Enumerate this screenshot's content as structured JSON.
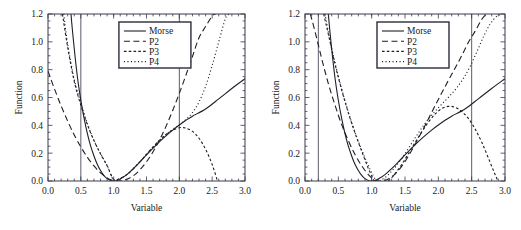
{
  "figure": {
    "panel_count": 2,
    "background_color": "#ffffff",
    "curve_color": "#1e1e28",
    "frame_color": "#3a3a4a"
  },
  "chart_data": [
    {
      "type": "line",
      "panel": "left",
      "title": "",
      "xlabel": "Variable",
      "ylabel": "Function",
      "xlim": [
        0.0,
        3.0
      ],
      "ylim": [
        0.0,
        1.2
      ],
      "xticks": [
        0.0,
        0.5,
        1.0,
        1.5,
        2.0,
        2.5,
        3.0
      ],
      "xtick_labels": [
        "0.0",
        "0.5",
        "1.0",
        "1.5",
        "2.0",
        "2.5",
        "3.0"
      ],
      "yticks": [
        0.0,
        0.2,
        0.4,
        0.6,
        0.8,
        1.0,
        1.2
      ],
      "ytick_labels": [
        "0.0",
        "0.2",
        "0.4",
        "0.6",
        "0.8",
        "1.0",
        "1.2"
      ],
      "minor_ticks": true,
      "grid": false,
      "legend_position": "upper center",
      "vertical_reference_lines": [
        0.5,
        2.0
      ],
      "fit_interval": [
        0.5,
        2.0
      ],
      "minimum": {
        "x": 1.0,
        "y": 0.0
      },
      "series": [
        {
          "name": "Morse",
          "style": "solid",
          "x": [
            0.3,
            0.35,
            0.4,
            0.45,
            0.5,
            0.55,
            0.6,
            0.65,
            0.7,
            0.75,
            0.8,
            0.85,
            0.9,
            0.95,
            1.0,
            1.05,
            1.1,
            1.2,
            1.3,
            1.4,
            1.5,
            1.6,
            1.7,
            1.8,
            1.9,
            2.0,
            2.1,
            2.2,
            2.4,
            2.6,
            2.8,
            3.0
          ],
          "y": [
            1.52,
            1.2,
            0.95,
            0.74,
            0.58,
            0.45,
            0.34,
            0.25,
            0.18,
            0.12,
            0.075,
            0.04,
            0.017,
            0.004,
            0.0,
            0.004,
            0.014,
            0.046,
            0.089,
            0.137,
            0.187,
            0.236,
            0.283,
            0.326,
            0.366,
            0.402,
            0.436,
            0.466,
            0.517,
            0.59,
            0.665,
            0.735
          ]
        },
        {
          "name": "P2",
          "style": "long-dash",
          "x": [
            0.0,
            0.1,
            0.2,
            0.3,
            0.4,
            0.5,
            0.6,
            0.7,
            0.8,
            0.9,
            1.0,
            1.1,
            1.2,
            1.3,
            1.4,
            1.5,
            1.6,
            1.7,
            1.8,
            1.9,
            2.0,
            2.1,
            2.2,
            2.3,
            2.4,
            2.5,
            2.55
          ],
          "y": [
            0.79,
            0.66,
            0.54,
            0.43,
            0.33,
            0.245,
            0.17,
            0.108,
            0.058,
            0.022,
            0.002,
            0.0,
            0.012,
            0.038,
            0.08,
            0.138,
            0.21,
            0.296,
            0.396,
            0.508,
            0.63,
            0.76,
            0.895,
            1.03,
            1.11,
            1.185,
            1.2
          ]
        },
        {
          "name": "P3",
          "style": "short-dash",
          "x": [
            0.22,
            0.3,
            0.4,
            0.5,
            0.6,
            0.7,
            0.8,
            0.9,
            1.0,
            1.1,
            1.2,
            1.3,
            1.4,
            1.5,
            1.6,
            1.7,
            1.8,
            1.9,
            2.0,
            2.05,
            2.1,
            2.2,
            2.3,
            2.4,
            2.5,
            2.6,
            2.68
          ],
          "y": [
            1.2,
            0.96,
            0.715,
            0.545,
            0.405,
            0.29,
            0.195,
            0.11,
            0.012,
            0.02,
            0.046,
            0.088,
            0.138,
            0.192,
            0.246,
            0.294,
            0.336,
            0.366,
            0.382,
            0.384,
            0.38,
            0.357,
            0.307,
            0.228,
            0.118,
            -0.03,
            -0.16
          ]
        },
        {
          "name": "P4",
          "style": "dotted",
          "x": [
            0.24,
            0.3,
            0.4,
            0.5,
            0.6,
            0.7,
            0.8,
            0.9,
            1.0,
            1.1,
            1.2,
            1.3,
            1.4,
            1.5,
            1.6,
            1.7,
            1.8,
            1.9,
            2.0,
            2.1,
            2.2,
            2.3,
            2.4,
            2.5,
            2.6,
            2.7,
            2.76
          ],
          "y": [
            1.2,
            0.98,
            0.73,
            0.56,
            0.412,
            0.292,
            0.196,
            0.11,
            0.006,
            0.018,
            0.046,
            0.09,
            0.14,
            0.192,
            0.244,
            0.292,
            0.336,
            0.372,
            0.404,
            0.442,
            0.492,
            0.568,
            0.68,
            0.83,
            1.0,
            1.165,
            1.2
          ]
        }
      ]
    },
    {
      "type": "line",
      "panel": "right",
      "title": "",
      "xlabel": "Variable",
      "ylabel": "Function",
      "xlim": [
        0.0,
        3.0
      ],
      "ylim": [
        0.0,
        1.2
      ],
      "xticks": [
        0.0,
        0.5,
        1.0,
        1.5,
        2.0,
        2.5,
        3.0
      ],
      "xtick_labels": [
        "0.0",
        "0.5",
        "1.0",
        "1.5",
        "2.0",
        "2.5",
        "3.0"
      ],
      "yticks": [
        0.0,
        0.2,
        0.4,
        0.6,
        0.8,
        1.0,
        1.2
      ],
      "ytick_labels": [
        "0.0",
        "0.2",
        "0.4",
        "0.6",
        "0.8",
        "1.0",
        "1.2"
      ],
      "minor_ticks": true,
      "grid": false,
      "legend_position": "upper center",
      "vertical_reference_lines": [
        0.2,
        2.5
      ],
      "fit_interval": [
        0.2,
        2.5
      ],
      "minimum": {
        "x": 1.0,
        "y": 0.0
      },
      "series": [
        {
          "name": "Morse",
          "style": "solid",
          "x": [
            0.3,
            0.35,
            0.4,
            0.45,
            0.5,
            0.55,
            0.6,
            0.65,
            0.7,
            0.75,
            0.8,
            0.85,
            0.9,
            0.95,
            1.0,
            1.05,
            1.1,
            1.2,
            1.3,
            1.4,
            1.5,
            1.6,
            1.7,
            1.8,
            1.9,
            2.0,
            2.1,
            2.2,
            2.4,
            2.6,
            2.8,
            3.0
          ],
          "y": [
            1.52,
            1.2,
            0.95,
            0.74,
            0.58,
            0.45,
            0.34,
            0.25,
            0.18,
            0.12,
            0.075,
            0.04,
            0.017,
            0.004,
            0.0,
            0.004,
            0.014,
            0.046,
            0.089,
            0.137,
            0.187,
            0.236,
            0.283,
            0.326,
            0.366,
            0.402,
            0.436,
            0.466,
            0.517,
            0.59,
            0.665,
            0.735
          ]
        },
        {
          "name": "P2",
          "style": "long-dash",
          "x": [
            0.08,
            0.15,
            0.25,
            0.35,
            0.45,
            0.55,
            0.65,
            0.75,
            0.85,
            0.95,
            1.05,
            1.15,
            1.25,
            1.35,
            1.45,
            1.55,
            1.65,
            1.75,
            1.85,
            1.95,
            2.05,
            2.15,
            2.25,
            2.35,
            2.45,
            2.55,
            2.65,
            2.72
          ],
          "y": [
            1.2,
            1.075,
            0.88,
            0.7,
            0.545,
            0.405,
            0.29,
            0.19,
            0.11,
            0.046,
            0.005,
            0.0,
            0.015,
            0.05,
            0.105,
            0.178,
            0.262,
            0.352,
            0.445,
            0.54,
            0.632,
            0.722,
            0.81,
            0.9,
            0.995,
            1.075,
            1.16,
            1.2
          ]
        },
        {
          "name": "P3",
          "style": "short-dash",
          "x": [
            0.28,
            0.35,
            0.45,
            0.55,
            0.65,
            0.75,
            0.85,
            0.95,
            1.05,
            1.1,
            1.15,
            1.25,
            1.35,
            1.45,
            1.55,
            1.65,
            1.75,
            1.85,
            1.95,
            2.05,
            2.15,
            2.25,
            2.35,
            2.45,
            2.55,
            2.65,
            2.75,
            2.85,
            2.95
          ],
          "y": [
            1.2,
            1.055,
            0.84,
            0.655,
            0.49,
            0.345,
            0.215,
            0.09,
            -0.01,
            -0.028,
            -0.03,
            0.0,
            0.052,
            0.118,
            0.196,
            0.276,
            0.352,
            0.422,
            0.48,
            0.52,
            0.536,
            0.53,
            0.5,
            0.45,
            0.375,
            0.28,
            0.166,
            0.048,
            -0.06
          ]
        },
        {
          "name": "P4",
          "style": "dotted",
          "x": [
            0.3,
            0.38,
            0.48,
            0.58,
            0.68,
            0.78,
            0.88,
            0.98,
            1.08,
            1.18,
            1.28,
            1.38,
            1.48,
            1.58,
            1.68,
            1.78,
            1.88,
            1.98,
            2.08,
            2.18,
            2.28,
            2.38,
            2.48,
            2.58,
            2.68,
            2.78,
            2.88,
            2.96
          ],
          "y": [
            1.2,
            1.0,
            0.79,
            0.61,
            0.45,
            0.31,
            0.19,
            0.08,
            0.0,
            0.018,
            0.06,
            0.116,
            0.182,
            0.256,
            0.33,
            0.4,
            0.462,
            0.516,
            0.566,
            0.616,
            0.672,
            0.74,
            0.826,
            0.93,
            1.04,
            1.13,
            1.185,
            1.2
          ]
        }
      ]
    }
  ]
}
